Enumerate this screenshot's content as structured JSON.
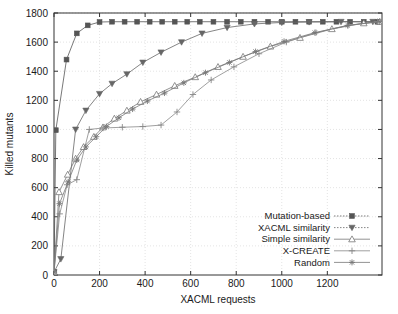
{
  "chart_data": {
    "type": "line",
    "title": "",
    "xlabel": "XACML requests",
    "ylabel": "Killed mutants",
    "xlim": [
      0,
      1440
    ],
    "ylim": [
      0,
      1800
    ],
    "xticks": [
      0,
      200,
      400,
      600,
      800,
      1000,
      1200
    ],
    "yticks": [
      0,
      200,
      400,
      600,
      800,
      1000,
      1200,
      1400,
      1600,
      1800
    ],
    "grid": true,
    "legend_position": "bottom-right",
    "series": [
      {
        "name": "Mutation-based",
        "marker": "filled-square",
        "color": "#555555",
        "points": [
          [
            0,
            20
          ],
          [
            8,
            995
          ],
          [
            55,
            1480
          ],
          [
            100,
            1660
          ],
          [
            148,
            1715
          ],
          [
            200,
            1738
          ],
          [
            255,
            1740
          ],
          [
            310,
            1740
          ],
          [
            365,
            1740
          ],
          [
            420,
            1740
          ],
          [
            475,
            1740
          ],
          [
            530,
            1740
          ],
          [
            585,
            1740
          ],
          [
            640,
            1740
          ],
          [
            700,
            1740
          ],
          [
            760,
            1740
          ],
          [
            820,
            1740
          ],
          [
            880,
            1740
          ],
          [
            940,
            1740
          ],
          [
            1000,
            1740
          ],
          [
            1060,
            1740
          ],
          [
            1120,
            1740
          ],
          [
            1180,
            1740
          ],
          [
            1240,
            1740
          ],
          [
            1300,
            1740
          ],
          [
            1360,
            1740
          ],
          [
            1420,
            1740
          ]
        ]
      },
      {
        "name": "XACML similarity",
        "marker": "filled-down-triangle",
        "color": "#666666",
        "points": [
          [
            0,
            20
          ],
          [
            30,
            110
          ],
          [
            95,
            1000
          ],
          [
            140,
            1130
          ],
          [
            200,
            1245
          ],
          [
            255,
            1315
          ],
          [
            320,
            1380
          ],
          [
            390,
            1460
          ],
          [
            470,
            1530
          ],
          [
            560,
            1600
          ],
          [
            650,
            1660
          ],
          [
            760,
            1700
          ],
          [
            880,
            1725
          ],
          [
            1000,
            1735
          ],
          [
            1120,
            1738
          ],
          [
            1260,
            1740
          ],
          [
            1400,
            1740
          ]
        ]
      },
      {
        "name": "Simple similarity",
        "marker": "open-up-triangle",
        "color": "#777777",
        "points": [
          [
            0,
            20
          ],
          [
            22,
            570
          ],
          [
            60,
            690
          ],
          [
            95,
            800
          ],
          [
            130,
            880
          ],
          [
            175,
            950
          ],
          [
            215,
            1015
          ],
          [
            265,
            1075
          ],
          [
            320,
            1130
          ],
          [
            380,
            1190
          ],
          [
            450,
            1240
          ],
          [
            530,
            1300
          ],
          [
            620,
            1360
          ],
          [
            720,
            1430
          ],
          [
            830,
            1500
          ],
          [
            950,
            1570
          ],
          [
            1080,
            1630
          ],
          [
            1220,
            1690
          ],
          [
            1360,
            1730
          ],
          [
            1430,
            1740
          ]
        ]
      },
      {
        "name": "X-CREATE",
        "marker": "plus",
        "color": "#888888",
        "points": [
          [
            0,
            20
          ],
          [
            25,
            420
          ],
          [
            58,
            620
          ],
          [
            100,
            655
          ],
          [
            155,
            1000
          ],
          [
            215,
            1010
          ],
          [
            300,
            1015
          ],
          [
            390,
            1020
          ],
          [
            470,
            1030
          ],
          [
            540,
            1120
          ],
          [
            610,
            1240
          ],
          [
            690,
            1340
          ],
          [
            790,
            1430
          ],
          [
            900,
            1520
          ],
          [
            1020,
            1600
          ],
          [
            1150,
            1665
          ],
          [
            1290,
            1715
          ],
          [
            1420,
            1740
          ]
        ]
      },
      {
        "name": "Random",
        "marker": "star-cross",
        "color": "#777777",
        "points": [
          [
            0,
            20
          ],
          [
            24,
            490
          ],
          [
            62,
            640
          ],
          [
            100,
            790
          ],
          [
            140,
            880
          ],
          [
            185,
            950
          ],
          [
            230,
            1020
          ],
          [
            285,
            1080
          ],
          [
            345,
            1140
          ],
          [
            410,
            1195
          ],
          [
            485,
            1250
          ],
          [
            570,
            1320
          ],
          [
            665,
            1390
          ],
          [
            770,
            1460
          ],
          [
            885,
            1535
          ],
          [
            1010,
            1605
          ],
          [
            1145,
            1665
          ],
          [
            1290,
            1715
          ],
          [
            1430,
            1740
          ]
        ]
      }
    ]
  }
}
